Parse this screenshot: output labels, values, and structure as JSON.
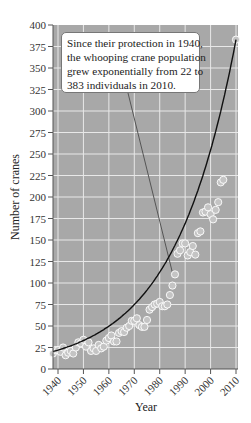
{
  "chart_data": {
    "type": "scatter",
    "title": "",
    "xlabel": "Year",
    "ylabel": "Number of cranes",
    "xlim": [
      1937,
      2011
    ],
    "ylim": [
      0,
      400
    ],
    "grid": true,
    "x_ticks": [
      1940,
      1950,
      1960,
      1970,
      1980,
      1990,
      2000,
      2010
    ],
    "y_ticks": [
      0,
      25,
      50,
      75,
      100,
      125,
      150,
      175,
      200,
      225,
      250,
      275,
      300,
      325,
      350,
      375,
      400
    ],
    "series": [
      {
        "name": "Observed population",
        "kind": "scatter",
        "x": [
          1938,
          1939,
          1940,
          1941,
          1942,
          1943,
          1944,
          1945,
          1946,
          1947,
          1948,
          1949,
          1950,
          1951,
          1952,
          1953,
          1954,
          1955,
          1956,
          1957,
          1958,
          1959,
          1960,
          1961,
          1962,
          1963,
          1964,
          1965,
          1966,
          1967,
          1968,
          1969,
          1970,
          1971,
          1972,
          1973,
          1974,
          1975,
          1976,
          1977,
          1978,
          1979,
          1980,
          1981,
          1982,
          1983,
          1984,
          1985,
          1986,
          1987,
          1988,
          1989,
          1990,
          1991,
          1992,
          1993,
          1994,
          1995,
          1996,
          1997,
          1998,
          1999,
          2000,
          2001,
          2002,
          2003,
          2004,
          2005,
          2010
        ],
        "y": [
          18,
          22,
          22,
          20,
          25,
          16,
          19,
          21,
          18,
          25,
          31,
          30,
          34,
          26,
          31,
          21,
          24,
          21,
          28,
          24,
          26,
          33,
          36,
          39,
          32,
          32,
          42,
          44,
          43,
          48,
          50,
          56,
          56,
          59,
          51,
          49,
          49,
          57,
          69,
          72,
          75,
          76,
          78,
          73,
          73,
          75,
          86,
          97,
          110,
          134,
          138,
          146,
          146,
          132,
          136,
          143,
          133,
          158,
          160,
          182,
          183,
          188,
          180,
          174,
          185,
          194,
          217,
          220,
          383
        ]
      },
      {
        "name": "Exponential fit",
        "kind": "line",
        "equation": "N = 22 * e^(r*(t-1940)), N(2010)=383",
        "x_start": 1938,
        "x_end": 2010,
        "y_start": 17,
        "y_end": 383
      }
    ],
    "annotations": [
      {
        "text": "Since their protection in 1940, the whooping crane population grew exponentially from 22 to 383 individuals in 2010.",
        "points_to": {
          "x": 1985,
          "y": 112
        }
      }
    ],
    "colors": {
      "plot_background": "#a8a8a8",
      "grid": "#e8e8e8",
      "marker_fill": "#c4c4c4",
      "marker_edge": "#ffffff",
      "curve": "#111111"
    }
  },
  "annotation": {
    "lines": [
      "Since their protection in 1940,",
      "the whooping crane population",
      "grew exponentially from 22 to",
      "383 individuals in 2010."
    ]
  },
  "axes": {
    "xlabel": "Year",
    "ylabel": "Number of cranes"
  }
}
